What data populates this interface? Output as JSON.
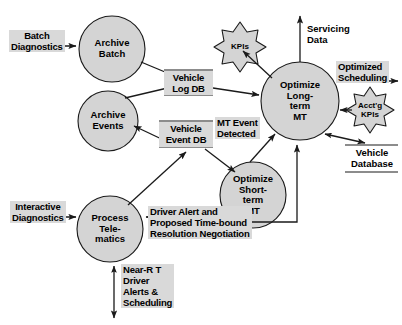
{
  "diagram": {
    "type": "data-flow-diagram",
    "colors": {
      "process_fill": "#d4d4d4",
      "label_fill": "#d9d9d9",
      "store_fill": "#d9d9d9",
      "star_fill": "#d4d4d4",
      "stroke": "#1a1a1a",
      "background": "#ffffff"
    }
  },
  "processes": [
    {
      "id": "archive-batch",
      "label": "Archive\nBatch"
    },
    {
      "id": "archive-events",
      "label": "Archive\nEvents"
    },
    {
      "id": "process-telematics",
      "label": "Process\nTele-\nmatics"
    },
    {
      "id": "optimize-long-term",
      "label": "Optimize\nLong-\nterm\nMT"
    },
    {
      "id": "optimize-short-term",
      "label": "Optimize\nShort-\nterm\nMT"
    }
  ],
  "datastores": [
    {
      "id": "vehicle-log-db",
      "label": "Vehicle\nLog DB"
    },
    {
      "id": "vehicle-event-db",
      "label": "Vehicle\nEvent DB"
    },
    {
      "id": "vehicle-database",
      "label": "Vehicle\nDatabase"
    }
  ],
  "stars": [
    {
      "id": "kpis",
      "label": "KPIs"
    },
    {
      "id": "acctg-kpis",
      "label": "Acct'g\nKPIs"
    }
  ],
  "flows": [
    {
      "id": "batch-diagnostics",
      "label": "Batch\nDiagnostics"
    },
    {
      "id": "interactive-diagnostics",
      "label": "Interactive\nDiagnostics"
    },
    {
      "id": "mt-event-detected",
      "label": "MT Event\nDetected"
    },
    {
      "id": "driver-alert-negotiation",
      "label": "Driver Alert and\nProposed Time-bound\nResolution Negotiation"
    },
    {
      "id": "near-rt-driver-alerts",
      "label": "Near-R T\nDriver\nAlerts &\nScheduling"
    },
    {
      "id": "optimized-scheduling",
      "label": "Optimized\nScheduling"
    },
    {
      "id": "servicing-data",
      "label": "Servicing\nData"
    }
  ]
}
